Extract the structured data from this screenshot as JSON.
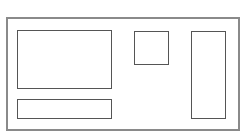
{
  "diagram": {
    "type": "wireframe-layout",
    "colors": {
      "background": "#ffffff",
      "outer_border": "#8a8a8a",
      "box_border": "#555555"
    },
    "outer_frame": {
      "x": 6,
      "y": 17,
      "w": 234,
      "h": 114
    },
    "blocks": [
      {
        "id": "large-panel",
        "x": 17,
        "y": 30,
        "w": 95,
        "h": 59
      },
      {
        "id": "bottom-bar",
        "x": 17,
        "y": 99,
        "w": 95,
        "h": 20
      },
      {
        "id": "square-block",
        "x": 134,
        "y": 31,
        "w": 35,
        "h": 34
      },
      {
        "id": "tall-column",
        "x": 191,
        "y": 31,
        "w": 35,
        "h": 88
      }
    ]
  }
}
